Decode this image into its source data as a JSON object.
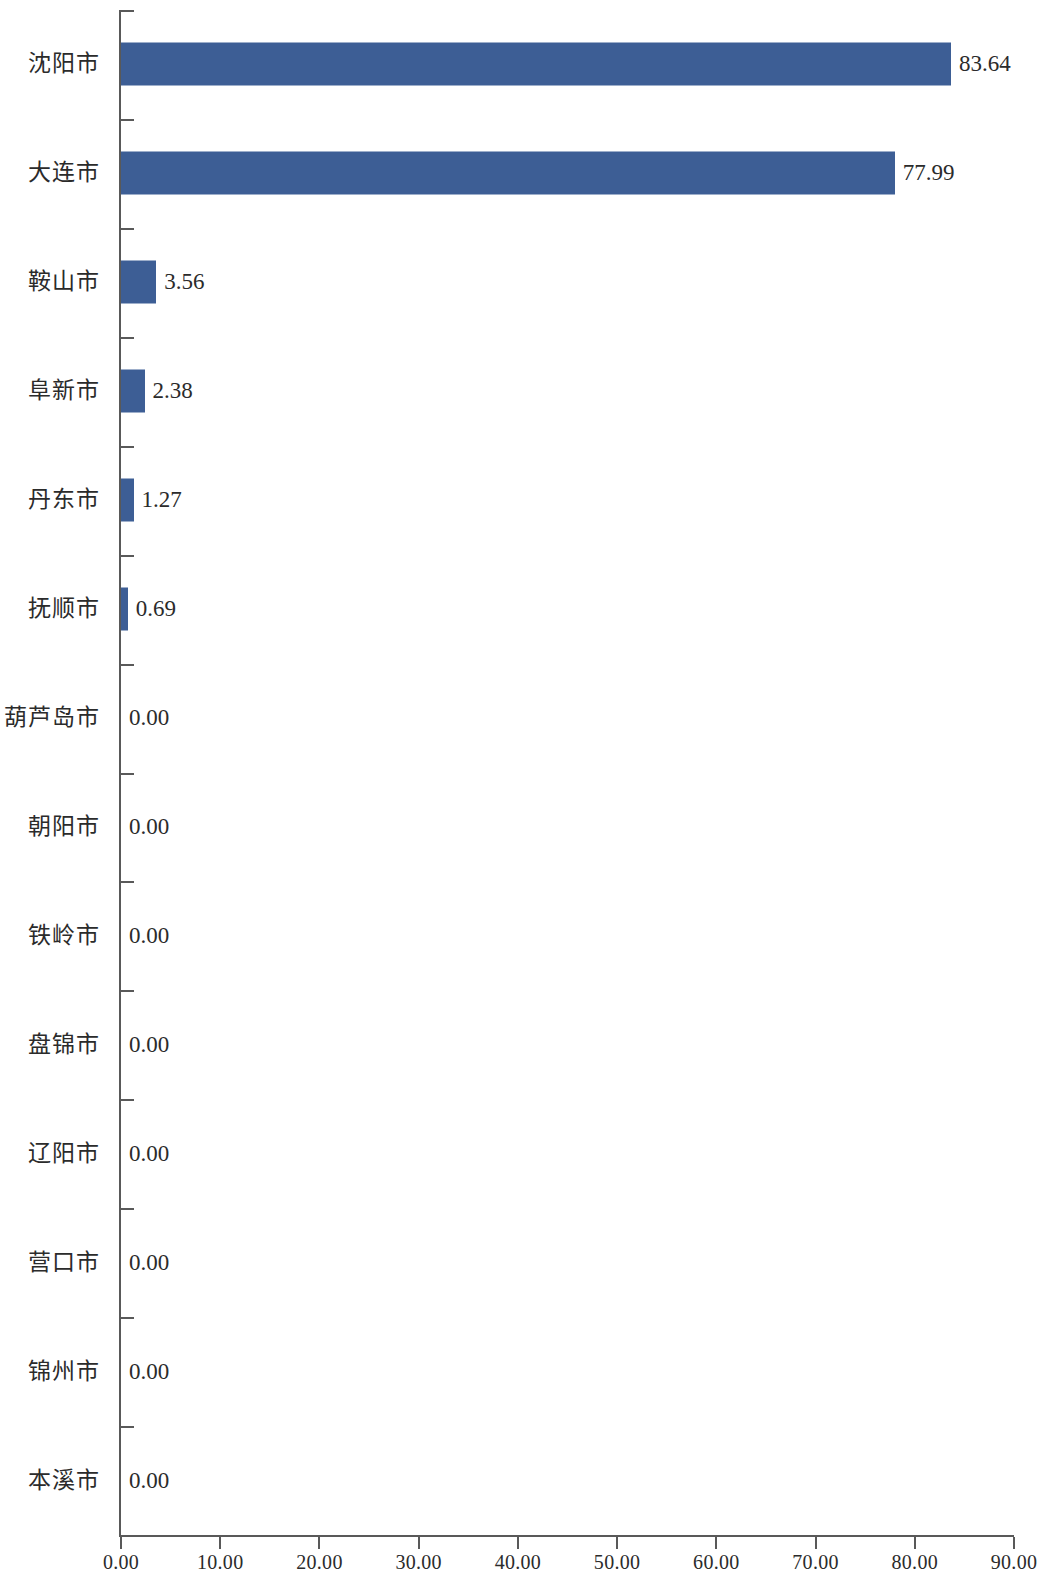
{
  "chart_data": {
    "type": "bar",
    "orientation": "horizontal",
    "title": "",
    "subtitle": "",
    "xlabel": "",
    "ylabel": "",
    "xlim": [
      0,
      90
    ],
    "xticks": [
      "0.00",
      "10.00",
      "20.00",
      "30.00",
      "40.00",
      "50.00",
      "60.00",
      "70.00",
      "80.00",
      "90.00"
    ],
    "xtick_values": [
      0,
      10,
      20,
      30,
      40,
      50,
      60,
      70,
      80,
      90
    ],
    "grid": false,
    "legend": false,
    "bar_color": "#3d5e95",
    "axis_color": "#595959",
    "background_color": "#ffffff",
    "categories": [
      "沈阳市",
      "大连市",
      "鞍山市",
      "阜新市",
      "丹东市",
      "抚顺市",
      "葫芦岛市",
      "朝阳市",
      "铁岭市",
      "盘锦市",
      "辽阳市",
      "营口市",
      "锦州市",
      "本溪市"
    ],
    "values": [
      83.64,
      77.99,
      3.56,
      2.38,
      1.27,
      0.69,
      0.0,
      0.0,
      0.0,
      0.0,
      0.0,
      0.0,
      0.0,
      0.0
    ],
    "value_labels": [
      "83.64",
      "77.99",
      "3.56",
      "2.38",
      "1.27",
      "0.69",
      "0.00",
      "0.00",
      "0.00",
      "0.00",
      "0.00",
      "0.00",
      "0.00",
      "0.00"
    ]
  }
}
